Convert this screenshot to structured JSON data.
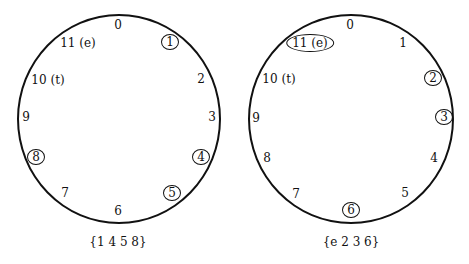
{
  "diagrams": [
    {
      "caption": "{1 4 5 8}",
      "labels": [
        "0",
        "1",
        "2",
        "3",
        "4",
        "5",
        "6",
        "7",
        "8",
        "9",
        "10 (t)",
        "11 (e)"
      ],
      "circled": [
        1,
        4,
        5,
        8
      ]
    },
    {
      "caption": "{e 2 3 6}",
      "labels": [
        "0",
        "1",
        "2",
        "3",
        "4",
        "5",
        "6",
        "7",
        "8",
        "9",
        "10 (t)",
        "11 (e)"
      ],
      "circled": [
        11,
        2,
        3,
        6
      ]
    }
  ]
}
